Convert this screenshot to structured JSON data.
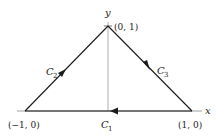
{
  "diagram": {
    "axis_labels": {
      "x": "x",
      "y": "y"
    },
    "points": [
      {
        "name": "apex",
        "label": "(0, 1)"
      },
      {
        "name": "left",
        "label": "(−1, 0)"
      },
      {
        "name": "right",
        "label": "(1, 0)"
      }
    ],
    "curves": [
      {
        "name": "C1",
        "letter": "C",
        "sub": "1",
        "from": "(1, 0)",
        "to": "(−1, 0)"
      },
      {
        "name": "C2",
        "letter": "C",
        "sub": "2",
        "from": "(−1, 0)",
        "to": "(0, 1)"
      },
      {
        "name": "C3",
        "letter": "C",
        "sub": "3",
        "from": "(0, 1)",
        "to": "(1, 0)"
      }
    ],
    "colors": {
      "line": "#1a1a1a",
      "axis": "#999999"
    }
  }
}
